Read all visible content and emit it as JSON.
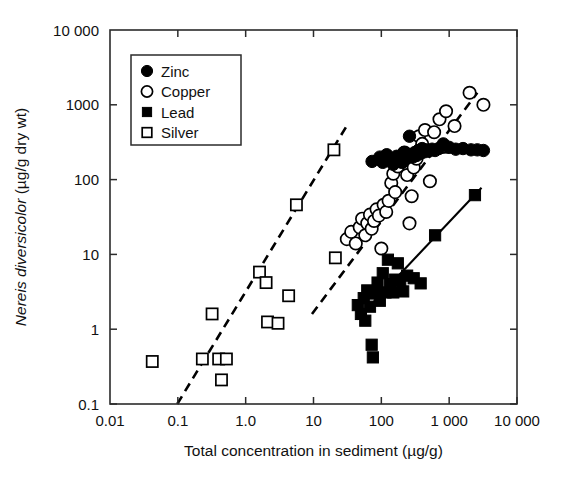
{
  "chart_data": {
    "type": "scatter",
    "title": "",
    "xlabel": "Total concentration in sediment (µg/g)",
    "ylabel_italic": "Nereis diversicolor",
    "ylabel_rest": " (µg/g dry wt)",
    "ylabel": "Nereis diversicolor (µg/g dry wt)",
    "xscale": "log",
    "yscale": "log",
    "xlim": [
      0.01,
      10000
    ],
    "ylim": [
      0.1,
      10000
    ],
    "grid": false,
    "frame": "box",
    "tick_direction": "in",
    "xticklabels": [
      "0.01",
      "0.1",
      "1.0",
      "10",
      "100",
      "1 000",
      "10 000"
    ],
    "xtickvalues": [
      0.01,
      0.1,
      1,
      10,
      100,
      1000,
      10000
    ],
    "yticklabels": [
      "10 000",
      "1000",
      "100",
      "10",
      "1",
      "0.1"
    ],
    "ytickvalues": [
      10000,
      1000,
      100,
      10,
      1,
      0.1
    ],
    "legend_position": "upper left",
    "series": [
      {
        "name": "Zinc",
        "marker": "filled-circle",
        "color": "#000000",
        "points": [
          [
            73,
            175
          ],
          [
            95,
            200
          ],
          [
            105,
            170
          ],
          [
            120,
            215
          ],
          [
            140,
            190
          ],
          [
            150,
            160
          ],
          [
            168,
            205
          ],
          [
            185,
            185
          ],
          [
            200,
            170
          ],
          [
            215,
            230
          ],
          [
            240,
            195
          ],
          [
            260,
            380
          ],
          [
            275,
            215
          ],
          [
            290,
            200
          ],
          [
            310,
            230
          ],
          [
            330,
            210
          ],
          [
            350,
            245
          ],
          [
            380,
            225
          ],
          [
            400,
            260
          ],
          [
            430,
            235
          ],
          [
            460,
            250
          ],
          [
            500,
            240
          ],
          [
            560,
            255
          ],
          [
            620,
            245
          ],
          [
            700,
            260
          ],
          [
            820,
            300
          ],
          [
            1000,
            270
          ],
          [
            1250,
            255
          ],
          [
            1600,
            260
          ],
          [
            2100,
            250
          ],
          [
            2600,
            250
          ],
          [
            3200,
            245
          ]
        ]
      },
      {
        "name": "Copper",
        "marker": "open-circle",
        "color": "#000000",
        "points": [
          [
            31,
            16
          ],
          [
            36,
            20
          ],
          [
            42,
            14
          ],
          [
            48,
            23
          ],
          [
            52,
            30
          ],
          [
            58,
            18
          ],
          [
            62,
            26
          ],
          [
            68,
            34
          ],
          [
            72,
            22
          ],
          [
            78,
            28
          ],
          [
            85,
            40
          ],
          [
            92,
            33
          ],
          [
            100,
            12
          ],
          [
            108,
            46
          ],
          [
            118,
            37
          ],
          [
            128,
            52
          ],
          [
            140,
            90
          ],
          [
            150,
            120
          ],
          [
            160,
            68
          ],
          [
            175,
            150
          ],
          [
            190,
            195
          ],
          [
            205,
            175
          ],
          [
            220,
            230
          ],
          [
            240,
            115
          ],
          [
            260,
            26
          ],
          [
            280,
            60
          ],
          [
            300,
            145
          ],
          [
            330,
            190
          ],
          [
            360,
            380
          ],
          [
            400,
            300
          ],
          [
            440,
            460
          ],
          [
            520,
            95
          ],
          [
            600,
            430
          ],
          [
            720,
            640
          ],
          [
            900,
            820
          ],
          [
            1200,
            520
          ],
          [
            2000,
            1450
          ],
          [
            3200,
            1000
          ]
        ]
      },
      {
        "name": "Lead",
        "marker": "filled-square",
        "color": "#000000",
        "points": [
          [
            45,
            2.1
          ],
          [
            50,
            1.6
          ],
          [
            55,
            2.6
          ],
          [
            58,
            1.3
          ],
          [
            62,
            3.3
          ],
          [
            68,
            2.0
          ],
          [
            72,
            0.62
          ],
          [
            75,
            0.42
          ],
          [
            80,
            3.0
          ],
          [
            88,
            4.2
          ],
          [
            95,
            2.4
          ],
          [
            105,
            5.6
          ],
          [
            115,
            3.1
          ],
          [
            125,
            8.5
          ],
          [
            135,
            4.0
          ],
          [
            150,
            3.1
          ],
          [
            160,
            4.6
          ],
          [
            175,
            7.6
          ],
          [
            190,
            4.4
          ],
          [
            210,
            3.2
          ],
          [
            240,
            5.2
          ],
          [
            300,
            4.8
          ],
          [
            380,
            4.1
          ],
          [
            620,
            18
          ],
          [
            2400,
            62
          ]
        ]
      },
      {
        "name": "Silver",
        "marker": "open-square",
        "color": "#000000",
        "points": [
          [
            0.042,
            0.37
          ],
          [
            0.23,
            0.4
          ],
          [
            0.32,
            1.6
          ],
          [
            0.4,
            0.4
          ],
          [
            0.44,
            0.21
          ],
          [
            0.52,
            0.4
          ],
          [
            1.6,
            5.8
          ],
          [
            2.0,
            4.2
          ],
          [
            2.1,
            1.25
          ],
          [
            3.0,
            1.2
          ],
          [
            4.3,
            2.8
          ],
          [
            5.6,
            46
          ],
          [
            20,
            250
          ],
          [
            21,
            9.0
          ]
        ]
      }
    ],
    "fit_lines": [
      {
        "name": "silver-trend",
        "style": "dashed",
        "x": [
          0.098,
          30
        ],
        "y": [
          0.1,
          500
        ]
      },
      {
        "name": "copper-trend",
        "style": "dashed",
        "x": [
          9.5,
          2600
        ],
        "y": [
          1.6,
          1450
        ]
      },
      {
        "name": "zinc-trend",
        "style": "solid",
        "x": [
          150,
          2700
        ],
        "y": [
          195,
          255
        ]
      },
      {
        "name": "lead-trend",
        "style": "solid",
        "x": [
          44,
          3000
        ],
        "y": [
          1.35,
          78
        ]
      }
    ],
    "legend_entries": [
      {
        "label": "Zinc",
        "marker": "filled-circle"
      },
      {
        "label": "Copper",
        "marker": "open-circle"
      },
      {
        "label": "Lead",
        "marker": "filled-square"
      },
      {
        "label": "Silver",
        "marker": "open-square"
      }
    ]
  }
}
